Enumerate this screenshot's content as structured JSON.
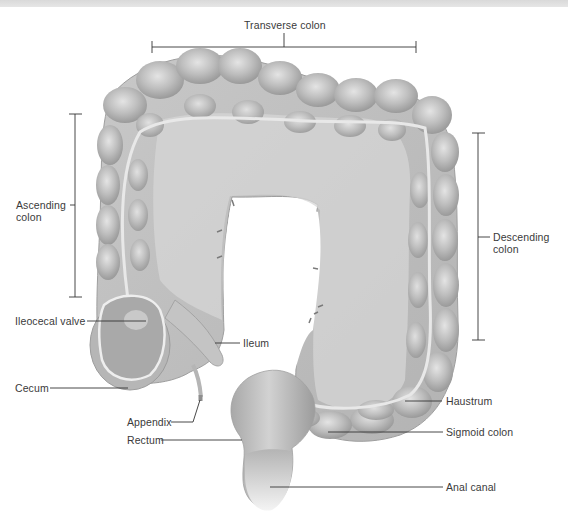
{
  "figure": {
    "topbar_color": "#dedede",
    "tissue_color": "#bdbdbd",
    "labels": {
      "transverse_colon": "Transverse colon",
      "ascending_colon_line1": "Ascending",
      "ascending_colon_line2": "colon",
      "descending_colon_line1": "Descending",
      "descending_colon_line2": "colon",
      "ileocecal_valve": "Ileocecal valve",
      "ileum": "Ileum",
      "cecum": "Cecum",
      "appendix": "Appendix",
      "rectum": "Rectum",
      "haustrum": "Haustrum",
      "sigmoid_colon": "Sigmoid colon",
      "anal_canal": "Anal canal"
    }
  }
}
